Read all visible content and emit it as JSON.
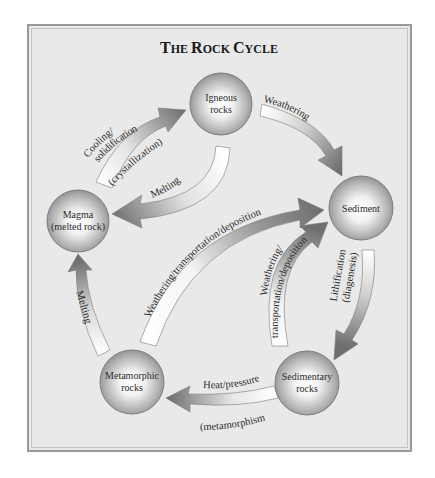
{
  "title": {
    "first": "T",
    "first_rest": "HE ",
    "second": "R",
    "second_rest": "OCK ",
    "third": "C",
    "third_rest": "YCLE"
  },
  "nodes": {
    "igneous": {
      "line1": "Igneous",
      "line2": "rocks"
    },
    "magma": {
      "line1": "Magma",
      "line2": "(melted rock)"
    },
    "sediment": {
      "line1": "Sediment"
    },
    "sedimentary": {
      "line1": "Sedimentary",
      "line2": "rocks"
    },
    "metamorphic": {
      "line1": "Metamorphic",
      "line2": "rocks"
    }
  },
  "arrows": {
    "cooling": {
      "line1": "Cooling/",
      "line2": "solidification",
      "line3": "(crystallization)"
    },
    "weathering_top": {
      "label": "Weathering"
    },
    "melting_igneous": {
      "label": "Melting"
    },
    "weathering_long": {
      "label": "Weathering/transportation/deposition"
    },
    "weathering_short": {
      "line1": "Weathering/",
      "line2": "transportation/deposition"
    },
    "lithification": {
      "line1": "Lithification",
      "line2": "(diagenesis)"
    },
    "heat": {
      "line1": "Heat/pressure",
      "line2": "(metamorphism)"
    },
    "melting_meta": {
      "label": "Melting"
    }
  },
  "colors": {
    "background": "#e9e9e9",
    "frame_border": "#9a9a9a",
    "arrow_dark": "#6e6e6e",
    "arrow_light": "#ffffff",
    "sphere_edge": "#7d7d7d"
  }
}
